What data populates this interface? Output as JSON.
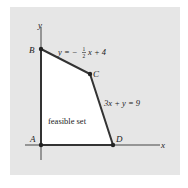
{
  "diagram": {
    "axes": {
      "x_label": "x",
      "y_label": "y"
    },
    "points": [
      {
        "name": "A",
        "label": "A"
      },
      {
        "name": "B",
        "label": "B"
      },
      {
        "name": "C",
        "label": "C"
      },
      {
        "name": "D",
        "label": "D"
      }
    ],
    "equations": {
      "line_bc": {
        "lhs": "y = −",
        "frac_num": "1",
        "frac_den": "2",
        "rhs": "x + 4"
      },
      "line_cd": "3x + y = 9"
    },
    "region_label": "feasible set",
    "colors": {
      "background": "#e6e6e6",
      "region": "#ffffff",
      "lines": "#333333"
    }
  }
}
